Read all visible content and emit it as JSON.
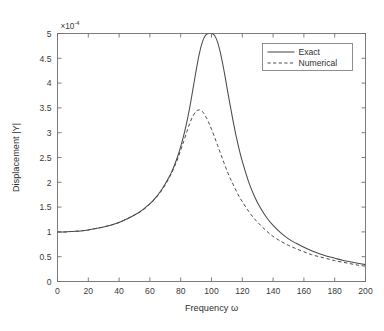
{
  "chart_data": {
    "type": "line",
    "title": "",
    "xlabel": "Frequency ω",
    "ylabel": "Displacement |Y|",
    "y_exponent_label": "×10",
    "y_exponent_power": "-4",
    "y_scale": 0.0001,
    "xlim": [
      0,
      200
    ],
    "ylim": [
      0,
      5
    ],
    "grid": false,
    "legend_position": "top-right",
    "xticks": [
      0,
      20,
      40,
      60,
      80,
      100,
      120,
      140,
      160,
      180,
      200
    ],
    "xticklabels": [
      "0",
      "20",
      "40",
      "60",
      "80",
      "100",
      "120",
      "140",
      "160",
      "180",
      "200"
    ],
    "yticks": [
      0,
      0.5,
      1,
      1.5,
      2,
      2.5,
      3,
      3.5,
      4,
      4.5,
      5
    ],
    "yticklabels": [
      "0",
      "0.5",
      "1",
      "1.5",
      "2",
      "2.5",
      "3",
      "3.5",
      "4",
      "4.5",
      "5"
    ],
    "x": [
      0,
      5,
      10,
      15,
      20,
      25,
      30,
      35,
      40,
      45,
      50,
      55,
      60,
      62,
      64,
      66,
      68,
      70,
      72,
      74,
      76,
      78,
      80,
      82,
      84,
      86,
      88,
      90,
      92,
      94,
      96,
      98,
      100,
      102,
      104,
      106,
      108,
      110,
      112,
      114,
      116,
      118,
      120,
      124,
      128,
      132,
      136,
      140,
      145,
      150,
      155,
      160,
      165,
      170,
      175,
      180,
      185,
      190,
      195,
      200
    ],
    "series": [
      {
        "name": "Exact",
        "style": "solid",
        "color": "#4a4a4a",
        "values": [
          1.0,
          1.0,
          1.01,
          1.02,
          1.04,
          1.07,
          1.1,
          1.14,
          1.19,
          1.26,
          1.34,
          1.44,
          1.57,
          1.63,
          1.7,
          1.78,
          1.87,
          1.97,
          2.08,
          2.2,
          2.35,
          2.52,
          2.72,
          2.95,
          3.22,
          3.53,
          3.89,
          4.25,
          4.58,
          4.82,
          4.96,
          5.0,
          5.0,
          4.96,
          4.82,
          4.58,
          4.27,
          3.92,
          3.57,
          3.24,
          2.93,
          2.66,
          2.42,
          2.02,
          1.71,
          1.47,
          1.28,
          1.13,
          0.98,
          0.86,
          0.77,
          0.69,
          0.62,
          0.56,
          0.51,
          0.47,
          0.43,
          0.4,
          0.37,
          0.34
        ]
      },
      {
        "name": "Numerical",
        "style": "dashed",
        "color": "#4a4a4a",
        "values": [
          1.0,
          1.0,
          1.01,
          1.02,
          1.04,
          1.07,
          1.1,
          1.14,
          1.19,
          1.26,
          1.34,
          1.43,
          1.56,
          1.62,
          1.69,
          1.77,
          1.85,
          1.95,
          2.06,
          2.18,
          2.32,
          2.47,
          2.65,
          2.83,
          3.02,
          3.2,
          3.34,
          3.43,
          3.46,
          3.43,
          3.34,
          3.22,
          3.07,
          2.91,
          2.74,
          2.57,
          2.4,
          2.24,
          2.09,
          1.96,
          1.83,
          1.71,
          1.61,
          1.42,
          1.26,
          1.13,
          1.01,
          0.91,
          0.81,
          0.73,
          0.66,
          0.6,
          0.54,
          0.5,
          0.46,
          0.42,
          0.39,
          0.36,
          0.33,
          0.31
        ]
      }
    ],
    "legend": [
      {
        "label": "Exact",
        "style": "solid"
      },
      {
        "label": "Numerical",
        "style": "dashed"
      }
    ]
  }
}
